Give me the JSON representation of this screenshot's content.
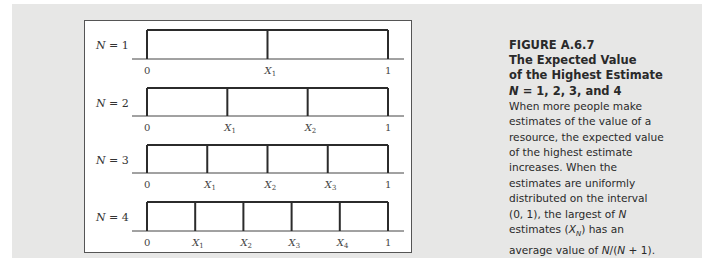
{
  "figure": {
    "number": "FIGURE A.6.7",
    "title_lines": [
      "The Expected Value",
      "of the Highest Estimate",
      "N = 1, 2, 3, and 4"
    ],
    "caption_lines": [
      "When more people make",
      "estimates of the value of a",
      "resource, the expected value",
      "of the highest estimate",
      "increases. When the",
      "estimates are uniformly",
      "distributed on the interval",
      "(0, 1), the largest of N",
      "estimates (X_N) has an",
      "average value of N/(N + 1)."
    ]
  },
  "diagram": {
    "rows": [
      {
        "label": "N = 1",
        "n": 1,
        "ticks": [
          "0",
          "X1",
          "1"
        ]
      },
      {
        "label": "N = 2",
        "n": 2,
        "ticks": [
          "0",
          "X1",
          "X2",
          "1"
        ]
      },
      {
        "label": "N = 3",
        "n": 3,
        "ticks": [
          "0",
          "X1",
          "X2",
          "X3",
          "1"
        ]
      },
      {
        "label": "N = 4",
        "n": 4,
        "ticks": [
          "0",
          "X1",
          "X2",
          "X3",
          "X4",
          "1"
        ]
      }
    ],
    "interval": [
      0,
      1
    ]
  },
  "colors": {
    "background": "#e7e7e6",
    "panel": "#ffffff",
    "line": "#2b2b2b",
    "text": "#2a2a2a"
  }
}
